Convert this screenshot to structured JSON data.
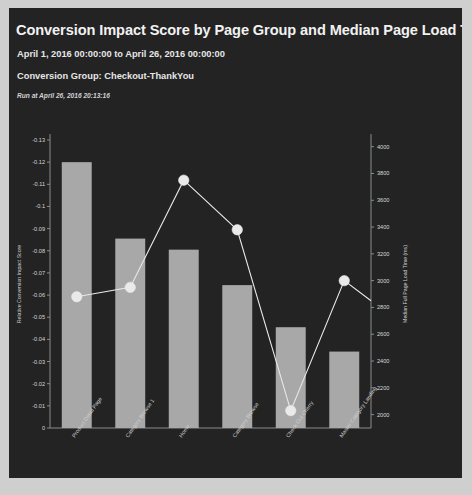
{
  "header": {
    "title": "Conversion Impact Score by Page Group and Median Page Load Time",
    "date_range": "April 1, 2016 00:00:00 to April 26, 2016 00:00:00",
    "conversion_group": "Conversion Group: Checkout-ThankYou",
    "run_at": "Run at April 26, 2016 20:13:16"
  },
  "colors": {
    "card_background": "#232323",
    "page_background": "#cfcfcf",
    "bar": "#a8a8a8",
    "line": "#e8e8e8",
    "marker": "#eaeaea",
    "axis": "#8c8c8c",
    "text": "#f2f2f2"
  },
  "chart_data": {
    "type": "bar",
    "title": "Conversion Impact Score by Page Group and Median Page Load Time",
    "xlabel": "",
    "ylabel": "Relative Conversion Impact Score",
    "y2label": "Median Full Page Load Time (ms)",
    "grid": false,
    "legend": "none",
    "categories": [
      "Product Detail Page",
      "Category Browse 1",
      "Home",
      "Category Browse",
      "Check Out Cherry",
      "Master Category Landing"
    ],
    "ylim": [
      -0.13,
      0
    ],
    "yticks": [
      -0.13,
      -0.12,
      -0.11,
      -0.1,
      -0.09,
      -0.08,
      -0.07,
      -0.06,
      -0.05,
      -0.04,
      -0.03,
      -0.02,
      -0.01,
      0
    ],
    "ytick_labels": [
      "-0.13",
      "-0.12",
      "-0.11",
      "-0.1",
      "-0.09",
      "-0.08",
      "-0.07",
      "-0.06",
      "-0.05",
      "-0.04",
      "-0.03",
      "-0.02",
      "-0.01",
      "0"
    ],
    "y2lim": [
      1900,
      4050
    ],
    "y2ticks": [
      2000,
      2200,
      2400,
      2600,
      2800,
      3000,
      3200,
      3400,
      3600,
      3800,
      4000
    ],
    "y2tick_labels": [
      "2000",
      "2200",
      "2400",
      "2600",
      "2800",
      "3000",
      "3200",
      "3400",
      "3600",
      "3800",
      "4000"
    ],
    "series": [
      {
        "name": "Relative Conversion Impact Score",
        "type": "bar",
        "axis": "left",
        "values": [
          -0.12,
          -0.0855,
          -0.0805,
          -0.0645,
          -0.0455,
          -0.0345
        ]
      },
      {
        "name": "Median Full Page Load Time (ms)",
        "type": "line",
        "axis": "right",
        "values": [
          2880,
          2950,
          3750,
          3380,
          2030,
          3000
        ],
        "trailing_value": 2850
      }
    ]
  }
}
